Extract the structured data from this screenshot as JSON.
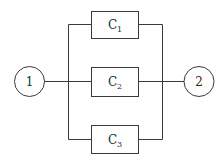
{
  "diagram": {
    "type": "parallel-system",
    "nodes": [
      {
        "id": "1",
        "label": "1"
      },
      {
        "id": "2",
        "label": "2"
      }
    ],
    "components": [
      {
        "letter": "C",
        "sub": "1"
      },
      {
        "letter": "C",
        "sub": "2"
      },
      {
        "letter": "C",
        "sub": "3"
      }
    ],
    "colors": {
      "line": "#3a3a3a",
      "background": "#ffffff"
    }
  }
}
